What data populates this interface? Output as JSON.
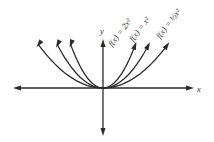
{
  "chart_data": {
    "type": "line",
    "title": "",
    "xlabel": "x",
    "ylabel": "y",
    "xlim": [
      -2.6,
      2.6
    ],
    "ylim": [
      -1.6,
      1.6
    ],
    "grid": false,
    "series": [
      {
        "name": "f(x) = 2x^2",
        "label": "f(x) = 2x²",
        "a": 2,
        "x_extent": 0.85
      },
      {
        "name": "f(x) = x^2",
        "label": "f(x) = x²",
        "a": 1,
        "x_extent": 1.2
      },
      {
        "name": "f(x) = 1/2 x^2",
        "label": "f(x) = ½x²",
        "a": 0.5,
        "x_extent": 1.7
      }
    ]
  }
}
